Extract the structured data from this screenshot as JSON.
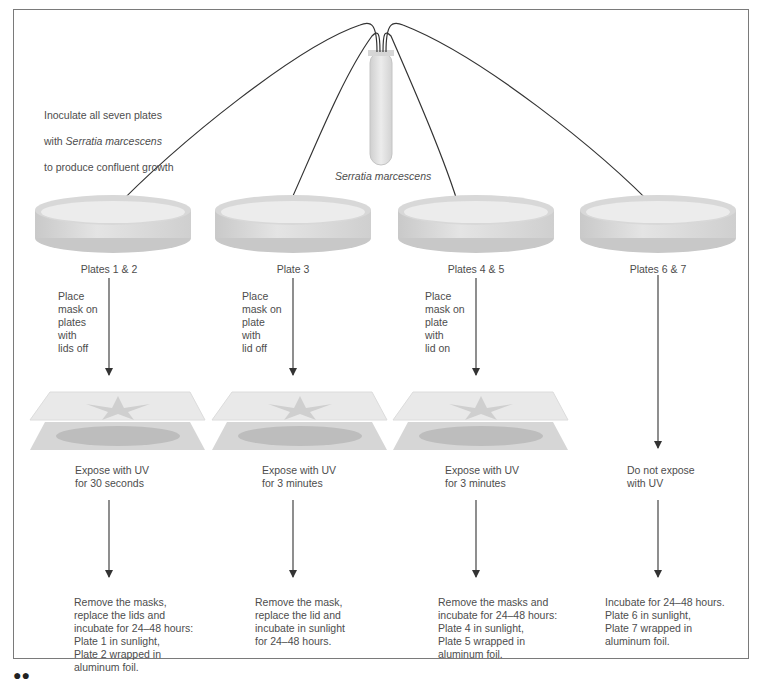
{
  "intro": {
    "line1": "Inoculate all seven plates",
    "line2_prefix": "with ",
    "line2_italic": "Serratia marcescens",
    "line3": "to produce confluent growth"
  },
  "tube_label": "Serratia marcescens",
  "columns": [
    {
      "plate_label": "Plates 1 & 2",
      "mask_step": "Place\nmask on\nplates\nwith\nlids off",
      "uv_step": "Expose with UV\nfor 30 seconds",
      "incubate_step": "Remove the masks,\nreplace the lids and\nincubate for 24–48 hours:\nPlate 1 in sunlight,\nPlate 2 wrapped in\naluminum foil."
    },
    {
      "plate_label": "Plate 3",
      "mask_step": "Place\nmask on\nplate\nwith\nlid off",
      "uv_step": "Expose with UV\nfor 3 minutes",
      "incubate_step": "Remove the mask,\nreplace the lid and\nincubate in sunlight\nfor 24–48 hours."
    },
    {
      "plate_label": "Plates 4 & 5",
      "mask_step": "Place\nmask on\nplate\nwith\nlid on",
      "uv_step": "Expose with UV\nfor 3 minutes",
      "incubate_step": "Remove the masks and\nincubate for 24–48 hours:\nPlate 4 in sunlight,\nPlate 5 wrapped in\naluminum foil."
    },
    {
      "plate_label": "Plates 6 & 7",
      "mask_step": "",
      "uv_step": "Do not expose\nwith UV",
      "incubate_step": "Incubate for 24–48 hours.\nPlate 6 in sunlight,\nPlate 7 wrapped in\naluminum foil."
    }
  ],
  "colors": {
    "frame": "#7a7a7a",
    "arrow": "#333333",
    "dish": "#d9d9d9",
    "text": "#4d4d4d"
  }
}
